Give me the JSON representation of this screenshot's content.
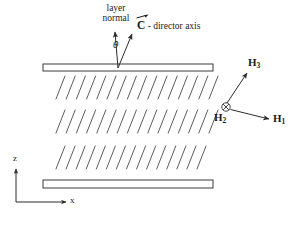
{
  "figure": {
    "type": "physics-schematic",
    "background_color": "#ffffff",
    "line_color": "#333333",
    "plate_fill": "#ffffff"
  },
  "labels": {
    "layer_normal_line1": "layer",
    "layer_normal_line2": "normal",
    "theta": "θ",
    "c_director_symbol": "C",
    "c_director_text": "- director axis",
    "h1": "H",
    "h1_sub": "1",
    "h2": "H",
    "h2_sub": "2",
    "h3": "H",
    "h3_sub": "3",
    "axis_z": "z",
    "axis_x": "x"
  },
  "geometry": {
    "top_plate": {
      "x": 43,
      "y": 64,
      "width": 170,
      "height": 7
    },
    "bottom_plate": {
      "x": 43,
      "y": 180,
      "width": 170,
      "height": 8
    },
    "smectic_rows": [
      {
        "y_top": 76,
        "y_bottom": 99,
        "x_start": 56,
        "x_end": 209,
        "count": 16,
        "slant_dx": 9
      },
      {
        "y_top": 110,
        "y_bottom": 133,
        "x_start": 56,
        "x_end": 209,
        "count": 16,
        "slant_dx": 9
      },
      {
        "y_top": 146,
        "y_bottom": 169,
        "x_start": 56,
        "x_end": 197,
        "count": 15,
        "slant_dx": 9
      }
    ],
    "normal_arrow": {
      "x1": 118,
      "y1": 68,
      "x2": 115,
      "y2": 31
    },
    "c_arrow": {
      "x1": 118,
      "y1": 68,
      "x2": 132,
      "y2": 33
    },
    "origin_symbol": {
      "cx": 226,
      "cy": 107,
      "r": 4.2,
      "kind": "circle-x"
    },
    "h1_arrow": {
      "x1": 230,
      "y1": 110,
      "x2": 270,
      "y2": 120
    },
    "h3_arrow": {
      "x1": 226,
      "y1": 102,
      "x2": 248,
      "y2": 72
    },
    "z_axis": {
      "x1": 16,
      "y1": 202,
      "x2": 16,
      "y2": 168
    },
    "x_axis": {
      "x1": 16,
      "y1": 202,
      "x2": 67,
      "y2": 202
    }
  }
}
